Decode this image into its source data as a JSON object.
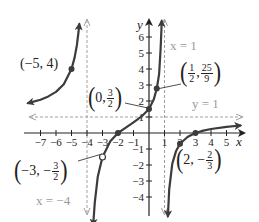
{
  "chart_data": {
    "type": "line",
    "title": "",
    "function": "f(x) = (x+2)(x-3) / ((x+4)(x-1))",
    "xlabel": "x",
    "ylabel": "y",
    "xlim": [
      -7.8,
      6
    ],
    "ylim": [
      -5,
      7
    ],
    "grid": false,
    "x_ticks": [
      -7,
      -6,
      -5,
      -4,
      -3,
      -2,
      -1,
      1,
      2,
      3,
      4,
      5
    ],
    "x_tick_labels": [
      "−7",
      "−6",
      "−5",
      "−4",
      "−3",
      "−2",
      "−1",
      "1",
      "2",
      "3",
      "4",
      "5"
    ],
    "y_ticks": [
      -4,
      -3,
      -2,
      -1,
      1,
      2,
      3,
      4,
      5,
      6
    ],
    "y_tick_labels": [
      "−4",
      "−3",
      "−2",
      "−1",
      "1",
      "2",
      "3",
      "4",
      "5",
      "6"
    ],
    "asymptotes": [
      {
        "type": "vertical",
        "value": -4,
        "label": "x = −4"
      },
      {
        "type": "vertical",
        "value": 1,
        "label": "x = 1"
      },
      {
        "type": "horizontal",
        "value": 1,
        "label": "y = 1"
      }
    ],
    "series": [
      {
        "name": "branch-left",
        "points": [
          [
            -7.8,
            1.87
          ],
          [
            -7,
            2.08
          ],
          [
            -6.5,
            2.29
          ],
          [
            -6,
            2.57
          ],
          [
            -5.5,
            3.05
          ],
          [
            -5,
            4.0
          ],
          [
            -4.8,
            4.71
          ],
          [
            -4.65,
            5.5
          ],
          [
            -4.55,
            6.31
          ],
          [
            -4.5,
            6.8
          ]
        ]
      },
      {
        "name": "branch-middle",
        "points": [
          [
            -3.6,
            -5.74
          ],
          [
            -3.5,
            -4.33
          ],
          [
            -3.3,
            -2.71
          ],
          [
            -3,
            -1.5
          ],
          [
            -2.5,
            -0.52
          ],
          [
            -2,
            0
          ],
          [
            -1.5,
            0.33
          ],
          [
            -1,
            0.67
          ],
          [
            -0.5,
            1.02
          ],
          [
            0,
            1.5
          ],
          [
            0.3,
            2.09
          ],
          [
            0.5,
            2.78
          ],
          [
            0.65,
            3.68
          ],
          [
            0.7,
            4.4
          ],
          [
            0.75,
            5.25
          ],
          [
            0.8,
            6.42
          ],
          [
            0.82,
            7.0
          ]
        ]
      },
      {
        "name": "branch-right",
        "points": [
          [
            1.22,
            -5.2
          ],
          [
            1.3,
            -3.53
          ],
          [
            1.5,
            -1.91
          ],
          [
            1.75,
            -1.12
          ],
          [
            2,
            -0.67
          ],
          [
            2.5,
            -0.24
          ],
          [
            3,
            0
          ],
          [
            3.5,
            0.15
          ],
          [
            4,
            0.25
          ],
          [
            5,
            0.39
          ],
          [
            5.9,
            0.47
          ]
        ]
      }
    ],
    "points": [
      {
        "x": -5,
        "y": 4,
        "label": "(−5, 4)",
        "type": "filled"
      },
      {
        "x": 0,
        "y": 1.5,
        "label": "(0, 3/2)",
        "type": "filled"
      },
      {
        "x": 0.5,
        "y": 2.7778,
        "label": "(1/2, 25/9)",
        "type": "filled"
      },
      {
        "x": 2,
        "y": -0.6667,
        "label": "(2, −2/3)",
        "type": "filled"
      },
      {
        "x": -3,
        "y": -1.5,
        "label": "(−3, −3/2)",
        "type": "open"
      },
      {
        "x": -2,
        "y": 0,
        "label": "",
        "type": "filled"
      },
      {
        "x": 3,
        "y": 0,
        "label": "",
        "type": "filled"
      }
    ]
  },
  "labels": {
    "p_m5_4": {
      "text": "(−5, 4)"
    },
    "p_0": {
      "a": "0,",
      "num": "3",
      "den": "2"
    },
    "p_half": {
      "num1": "1",
      "den1": "2",
      "num2": "25",
      "den2": "9"
    },
    "p_2": {
      "a": "2, −",
      "num": "2",
      "den": "3"
    },
    "p_m3": {
      "a": "−3, −",
      "num": "3",
      "den": "2"
    },
    "x_eq_1": "x = 1",
    "y_eq_1": "y = 1",
    "x_eq_m4": "x = −4",
    "x_axis": "x",
    "y_axis": "y",
    "lparen": "(",
    "rparen": ")"
  },
  "style": {
    "curve_color": "#3c3c3c",
    "axis_color": "#222222",
    "asymptote_color": "#a0a0a0",
    "label_color": "#222222",
    "asym_label_color": "#9a9a9a"
  }
}
